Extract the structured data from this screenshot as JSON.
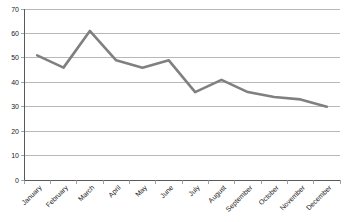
{
  "chart_data": {
    "type": "line",
    "title": "",
    "subtitle": "",
    "xlabel": "",
    "ylabel": "",
    "categories": [
      "January",
      "February",
      "March",
      "April",
      "May",
      "June",
      "July",
      "August",
      "September",
      "October",
      "November",
      "December"
    ],
    "values": [
      51,
      46,
      61,
      49,
      46,
      49,
      36,
      41,
      36,
      34,
      33,
      30
    ],
    "series": [
      {
        "name": "Series 1",
        "values": [
          51,
          46,
          61,
          49,
          46,
          49,
          36,
          41,
          36,
          34,
          33,
          30
        ]
      }
    ],
    "ylim": [
      0,
      70
    ],
    "ytick_values": [
      0,
      10,
      20,
      30,
      40,
      50,
      60,
      70
    ],
    "ytick_labels": [
      "0",
      "10",
      "20",
      "30",
      "40",
      "50",
      "60",
      "70"
    ],
    "grid": true,
    "grid_axis": "y",
    "legend": false,
    "legend_position": "none",
    "annotations": [],
    "xtick_rotation": -45,
    "line_color": "#808080",
    "grid_color": "#a6a6a6",
    "axis_color": "#5a5a5a",
    "background_color": "#ffffff",
    "text_color": "#1a1a1a"
  }
}
